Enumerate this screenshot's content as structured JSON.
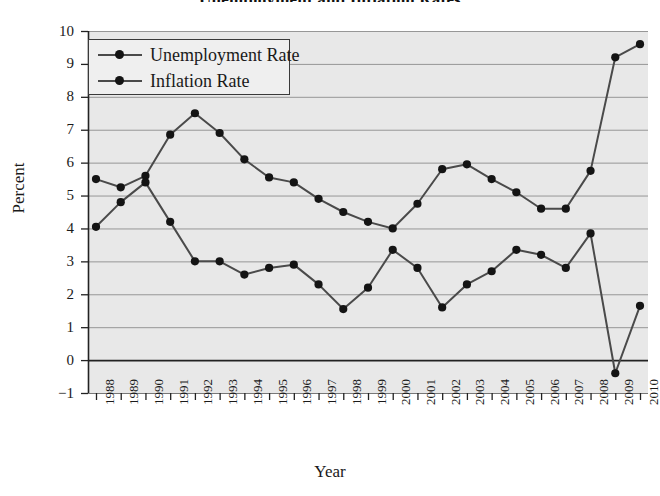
{
  "chart_data": {
    "type": "line",
    "title": "Unemployment and Inflation Rates",
    "xlabel": "Year",
    "ylabel": "Percent",
    "grid": true,
    "legend_position": "top-left",
    "xlim": [
      1988,
      2010
    ],
    "ylim": [
      -1,
      10
    ],
    "yticks": [
      "10",
      "9",
      "8",
      "7",
      "6",
      "5",
      "4",
      "3",
      "2",
      "1",
      "0",
      "−1"
    ],
    "ytick_values": [
      10,
      9,
      8,
      7,
      6,
      5,
      4,
      3,
      2,
      1,
      0,
      -1
    ],
    "categories": [
      "1988",
      "1989",
      "1990",
      "1991",
      "1992",
      "1993",
      "1994",
      "1995",
      "1996",
      "1997",
      "1998",
      "1999",
      "2000",
      "2001",
      "2002",
      "2003",
      "2004",
      "2005",
      "2006",
      "2007",
      "2008",
      "2009",
      "2010"
    ],
    "x": [
      1988,
      1989,
      1990,
      1991,
      1992,
      1993,
      1994,
      1995,
      1996,
      1997,
      1998,
      1999,
      2000,
      2001,
      2002,
      2003,
      2004,
      2005,
      2006,
      2007,
      2008,
      2009,
      2010
    ],
    "series": [
      {
        "name": "Unemployment Rate",
        "color": "#4a4a4a",
        "marker": "circle",
        "values": [
          5.5,
          5.25,
          5.6,
          6.85,
          7.5,
          6.9,
          6.1,
          5.55,
          5.4,
          4.9,
          4.5,
          4.2,
          4.0,
          4.75,
          5.8,
          5.95,
          5.5,
          5.1,
          4.6,
          4.6,
          5.75,
          9.2,
          9.6
        ]
      },
      {
        "name": "Inflation Rate",
        "color": "#4a4a4a",
        "marker": "circle",
        "values": [
          4.05,
          4.8,
          5.4,
          4.2,
          3.0,
          3.0,
          2.6,
          2.8,
          2.9,
          2.3,
          1.55,
          2.2,
          3.35,
          2.8,
          1.6,
          2.3,
          2.7,
          3.35,
          3.2,
          2.8,
          3.85,
          -0.4,
          1.65
        ]
      }
    ]
  }
}
